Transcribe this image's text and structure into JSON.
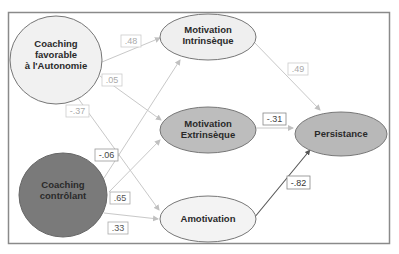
{
  "colors": {
    "frame": "#8a8a8a",
    "light_fill": "#f0f0f0",
    "mid_fill": "#bdbdbd",
    "dark_fill": "#7a7a7a",
    "node_stroke": "#777777",
    "arrow_light": "#c8c8c8",
    "arrow_dark": "#555555",
    "label_light": "#aaaaaa",
    "label_dark": "#333333"
  },
  "nodes": {
    "coaching_autonomie": {
      "line1": "Coaching",
      "line2": "favorable",
      "line3": "à l'Autonomie"
    },
    "coaching_controlant": {
      "line1": "Coaching",
      "line2": "contrôlant"
    },
    "motivation_intrinseque": {
      "line1": "Motivation",
      "line2": "Intrinsèque"
    },
    "motivation_extrinseque": {
      "line1": "Motivation",
      "line2": "Extrinsèque"
    },
    "amotivation": {
      "line1": "Amotivation"
    },
    "persistance": {
      "line1": "Persistance"
    }
  },
  "paths": {
    "autonomie_to_intrinseque": ".48",
    "autonomie_to_extrinseque": ".05",
    "autonomie_to_amotivation": "-.37",
    "controlant_to_intrinseque": "-.06",
    "controlant_to_extrinseque": ".65",
    "controlant_to_amotivation": ".33",
    "intrinseque_to_persistance": ".49",
    "extrinseque_to_persistance": "-.31",
    "amotivation_to_persistance": "-.82"
  }
}
